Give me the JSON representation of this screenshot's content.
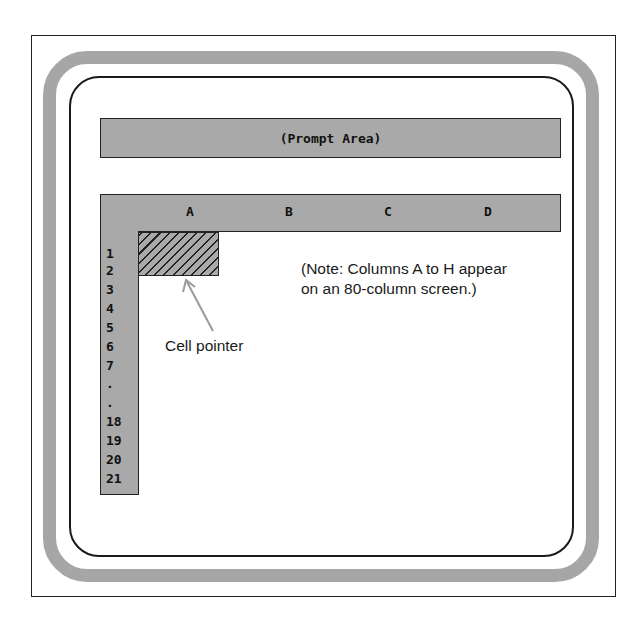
{
  "diagram": {
    "prompt_area": {
      "label": "(Prompt Area)"
    },
    "column_headers": [
      {
        "label": "A",
        "x": 190
      },
      {
        "label": "B",
        "x": 289
      },
      {
        "label": "C",
        "x": 388
      },
      {
        "label": "D",
        "x": 488
      }
    ],
    "row_headers": [
      {
        "label": "1",
        "y": 246
      },
      {
        "label": "2",
        "y": 263
      },
      {
        "label": "3",
        "y": 282
      },
      {
        "label": "4",
        "y": 301
      },
      {
        "label": "5",
        "y": 320
      },
      {
        "label": "6",
        "y": 339
      },
      {
        "label": "7",
        "y": 358
      },
      {
        "label": ".",
        "y": 376
      },
      {
        "label": ".",
        "y": 395
      },
      {
        "label": "18",
        "y": 414
      },
      {
        "label": "19",
        "y": 433
      },
      {
        "label": "20",
        "y": 452
      },
      {
        "label": "21",
        "y": 471
      }
    ],
    "cell_pointer": {
      "label": "Cell pointer",
      "cell": "A1"
    },
    "note": {
      "line1": "(Note: Columns A to H appear",
      "line2": "on an 80-column screen.)"
    },
    "colors": {
      "bezel": "#a6a6a6",
      "header_fill": "#a9a9a9",
      "line": "#222222",
      "arrow": "#9a9a9a"
    }
  }
}
